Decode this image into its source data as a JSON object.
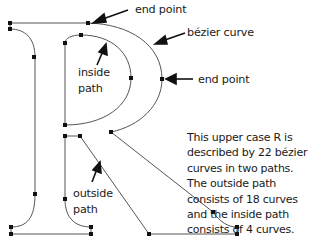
{
  "labels": {
    "end_point_top": "end point",
    "bezier_curve": "bézier curve",
    "end_point_right": "end point",
    "inside_path": "inside\npath",
    "inside_path_line1": "inside",
    "inside_path_line2": "path",
    "outside_path_line1": "outside",
    "outside_path_line2": "path"
  },
  "description": "This upper case R is described by 22 bézier curves in two paths. The outside path consists of 18 curves and the inside path consists of 4 curves.",
  "facts": {
    "letter": "R",
    "total_bezier_curves": 22,
    "paths": 2,
    "outside_path_curves": 18,
    "inside_path_curves": 4
  },
  "colors": {
    "stroke": "#555555",
    "point": "#111111",
    "text": "#1a1a1a"
  }
}
